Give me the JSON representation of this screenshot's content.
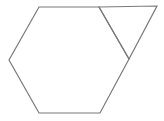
{
  "diagram": {
    "stroke_color": "#7a7a7a",
    "background": "#ffffff",
    "shapes": [
      {
        "name": "hexagon",
        "points": [
          [
            39,
            7
          ],
          [
            99,
            7
          ],
          [
            129,
            59
          ],
          [
            100,
            113
          ],
          [
            39,
            113
          ],
          [
            9,
            60
          ]
        ]
      },
      {
        "name": "triangle",
        "points": [
          [
            99,
            7
          ],
          [
            157,
            6
          ],
          [
            129,
            59
          ]
        ]
      }
    ]
  }
}
